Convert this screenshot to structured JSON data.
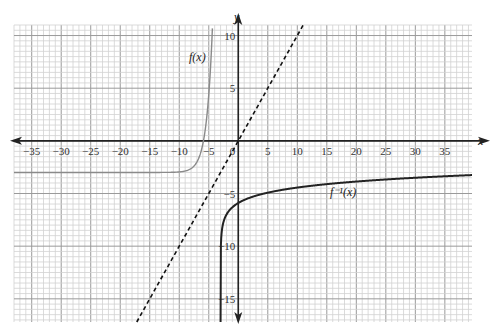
{
  "chart_data": {
    "type": "line",
    "title": "",
    "xlabel": "x",
    "ylabel": "y",
    "xlim": [
      -38,
      39.6
    ],
    "ylim": [
      -17.2,
      11
    ],
    "grid": true,
    "x_ticks": [
      -35,
      -30,
      -25,
      -20,
      -15,
      -10,
      -5,
      5,
      10,
      15,
      20,
      25,
      30,
      35
    ],
    "x_tick_labels": [
      "−35",
      "−30",
      "−25",
      "−20",
      "−15",
      "−10",
      "−5",
      "5",
      "10",
      "15",
      "20",
      "25",
      "30",
      "35"
    ],
    "y_ticks": [
      10,
      5,
      -5,
      -10,
      -15
    ],
    "y_tick_labels": [
      "10",
      "5",
      "−5",
      "−10",
      "−15"
    ],
    "origin_label": "0",
    "series": [
      {
        "name": "f(x)",
        "label": "f(x)",
        "style": "solid",
        "color": "#8a8a8a",
        "formula": "e^(x+7) - 3",
        "horizontal_asymptote": -3,
        "points": [
          [
            -38,
            -3
          ],
          [
            -10,
            -2.95
          ],
          [
            -8,
            -2.63
          ],
          [
            -7,
            -2
          ],
          [
            -6,
            -0.28
          ],
          [
            -5.5,
            1.48
          ],
          [
            -5,
            4.39
          ],
          [
            -4.6,
            8.02
          ],
          [
            -4.4,
            10.46
          ]
        ]
      },
      {
        "name": "f^-1(x)",
        "label": "f⁻¹(x)",
        "style": "solid",
        "color": "#222222",
        "formula": "ln(x+3) - 7",
        "vertical_asymptote": -3,
        "points": [
          [
            -2.99,
            -11.6
          ],
          [
            -2.9,
            -9.3
          ],
          [
            -2,
            -7
          ],
          [
            0,
            -5.9
          ],
          [
            5,
            -4.92
          ],
          [
            10,
            -4.43
          ],
          [
            20,
            -3.86
          ],
          [
            30,
            -3.5
          ],
          [
            39.6,
            -3.25
          ]
        ]
      },
      {
        "name": "y = x",
        "label": "",
        "style": "dashed",
        "color": "#111111",
        "points": [
          [
            -17.2,
            -17.2
          ],
          [
            11,
            11
          ]
        ]
      }
    ]
  }
}
